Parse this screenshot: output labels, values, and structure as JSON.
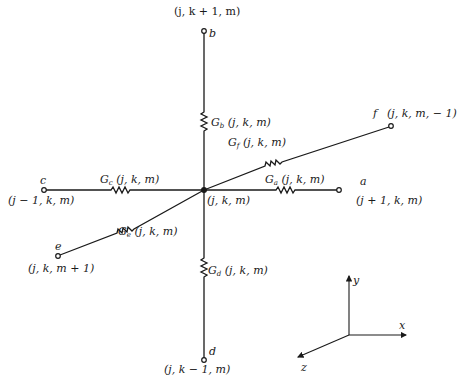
{
  "diagram": {
    "center": {
      "label": "(j, k, m)"
    },
    "nodes": {
      "a": {
        "letter": "a",
        "coords": "(j + 1, k, m)"
      },
      "b": {
        "letter": "b",
        "coords": "(j, k + 1, m)"
      },
      "c": {
        "letter": "c",
        "coords": "(j − 1, k, m)"
      },
      "d": {
        "letter": "d",
        "coords": "(j, k − 1, m)"
      },
      "e": {
        "letter": "e",
        "coords": "(j, k, m + 1)"
      },
      "f": {
        "letter": "f",
        "coords": "(j, k, m, − 1)"
      }
    },
    "conductances": {
      "a": {
        "sym": "G",
        "sub": "a",
        "args": "(j, k, m)"
      },
      "b": {
        "sym": "G",
        "sub": "b",
        "args": "(j, k, m)"
      },
      "c": {
        "sym": "G",
        "sub": "c",
        "args": "(j, k, m)"
      },
      "d": {
        "sym": "G",
        "sub": "d",
        "args": "(j, k, m)"
      },
      "e": {
        "sym": "G",
        "sub": "e",
        "args": "(j, k, m)"
      },
      "f": {
        "sym": "G",
        "sub": "f",
        "args": "(j, k, m)"
      }
    },
    "axes": {
      "x": "x",
      "y": "y",
      "z": "z"
    },
    "colors": {
      "ink": "#1a1a1a",
      "background": "#ffffff"
    }
  }
}
